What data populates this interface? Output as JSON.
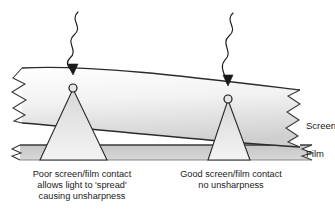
{
  "diagram": {
    "background_color": "#ffffff",
    "line_color": "#1a1a1a",
    "screen_fill_light": "#ffffff",
    "screen_fill_dark": "#d2d2d2",
    "film_fill": "#c9c9c9",
    "cone_fill": "#e3e3e3",
    "labels": {
      "screen": "Screen",
      "film": "Film"
    },
    "captions": {
      "left": {
        "line1": "Poor screen/film contact",
        "line2": "allows light to 'spread'",
        "line3": "causing unsharpness"
      },
      "right": {
        "line1": "Good screen/film contact",
        "line2": "no unsharpness"
      }
    },
    "elements": {
      "xray_left": "wavy-xray-arrow-left",
      "xray_right": "wavy-xray-arrow-right",
      "emission_point_left": "light-emission-point-left",
      "emission_point_right": "light-emission-point-right",
      "light_cone_left": "spreading-light-cone",
      "light_cone_right": "narrow-light-cone",
      "break_left": "torn-edge-left",
      "break_right": "torn-edge-right",
      "screen_layer": "phosphor-screen-layer",
      "film_layer": "film-layer"
    }
  }
}
